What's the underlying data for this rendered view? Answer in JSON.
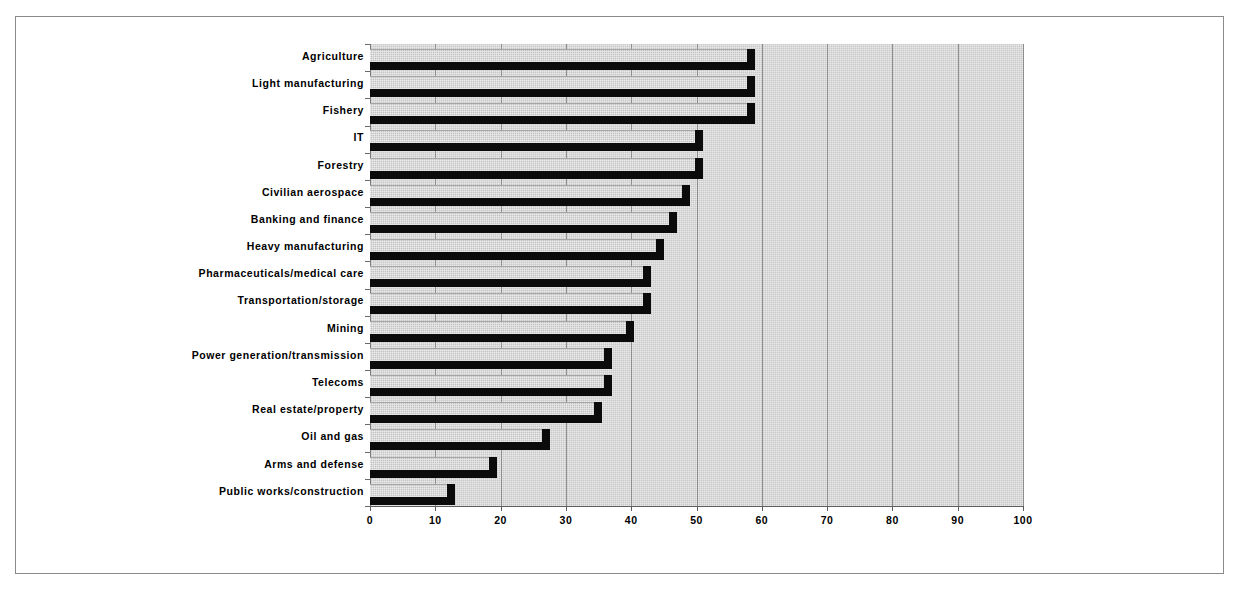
{
  "chart_data": {
    "type": "bar",
    "orientation": "horizontal",
    "title": "",
    "subtitle": "",
    "xlabel": "",
    "ylabel": "",
    "xlim": [
      0,
      100
    ],
    "xticks": [
      0,
      10,
      20,
      30,
      40,
      50,
      60,
      70,
      80,
      90,
      100
    ],
    "xtick_labels": [
      "0",
      "10",
      "20",
      "30",
      "40",
      "50",
      "60",
      "70",
      "80",
      "90",
      "100"
    ],
    "grid": true,
    "grid_axis": "x",
    "legend": false,
    "legend_position": "none",
    "plot_background": "#c9c9c9",
    "bar_fill_color": "#c4c4c4",
    "bar_shadow_color": "#0b0b0b",
    "categories": [
      "Agriculture",
      "Light manufacturing",
      "Fishery",
      "IT",
      "Forestry",
      "Civilian aerospace",
      "Banking and finance",
      "Heavy manufacturing",
      "Pharmaceuticals/medical care",
      "Transportation/storage",
      "Mining",
      "Power generation/transmission",
      "Telecoms",
      "Real estate/property",
      "Oil and gas",
      "Arms and defense",
      "Public works/construction"
    ],
    "values": [
      59,
      59,
      59,
      51,
      51,
      49,
      47,
      45,
      43,
      43,
      40.5,
      37,
      37,
      35.5,
      27.5,
      19.5,
      13
    ]
  }
}
